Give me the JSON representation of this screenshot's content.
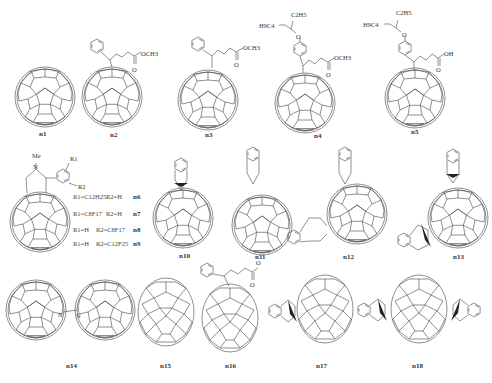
{
  "figure": {
    "compounds": [
      {
        "id": "n1",
        "label": "n1",
        "cage": "C60",
        "addend": "none"
      },
      {
        "id": "n2",
        "label": "n2",
        "cage": "C60",
        "addend": "phenyl-butyric methyl ester (methanofullerene)",
        "groups": [
          "OCH3",
          "O"
        ]
      },
      {
        "id": "n3",
        "label": "n3",
        "cage": "C60",
        "addend": "phenyl-pentanoic methyl ester",
        "groups": [
          "OCH3",
          "O"
        ]
      },
      {
        "id": "n4",
        "label": "n4",
        "cage": "C60",
        "addend": "alkoxyphenyl-butyric methyl ester",
        "groups": [
          "C2H5",
          "H9C4",
          "O",
          "OCH3",
          "O"
        ]
      },
      {
        "id": "n5",
        "label": "n5",
        "cage": "C60",
        "addend": "alkoxyphenyl-butyric acid",
        "groups": [
          "C2H5",
          "H9C4",
          "O",
          "OH",
          "O"
        ]
      },
      {
        "id": "n6-n9",
        "label": "",
        "cage": "C60",
        "addend": "N-methyl fulleropyrrolidine",
        "groups": [
          "Me",
          "N",
          "R1",
          "R2"
        ]
      },
      {
        "id": "n10",
        "label": "n10",
        "cage": "C60",
        "addend": "indene"
      },
      {
        "id": "n11",
        "label": "n11",
        "cage": "C60",
        "addend": "dihydronaphthyl (o-xylylene)"
      },
      {
        "id": "n12",
        "label": "n12",
        "cage": "C60",
        "addend": "bis-dihydronaphthyl"
      },
      {
        "id": "n13",
        "label": "n13",
        "cage": "C60",
        "addend": "bis-indene"
      },
      {
        "id": "n14",
        "label": "n14",
        "cage": "C59N dimer",
        "addend": "azafullerene dimer",
        "groups": [
          "N",
          "N"
        ]
      },
      {
        "id": "n15",
        "label": "n15",
        "cage": "C70",
        "addend": "none"
      },
      {
        "id": "n16",
        "label": "n16",
        "cage": "C70",
        "addend": "phenyl-butyric methyl ester",
        "groups": [
          "O",
          "O"
        ]
      },
      {
        "id": "n17",
        "label": "n17",
        "cage": "C70",
        "addend": "indene"
      },
      {
        "id": "n18",
        "label": "n18",
        "cage": "C70",
        "addend": "bis-indene"
      }
    ],
    "rgroup_table": [
      {
        "r1": "R1=C12H25",
        "r2": "R2=H",
        "label": "n6"
      },
      {
        "r1": "R1=C8F17",
        "r2": "R2=H",
        "label": "n7"
      },
      {
        "r1": "R1=H",
        "r2": "R2=C8F17",
        "label": "n8"
      },
      {
        "r1": "R1=H",
        "r2": "R2=C12F25",
        "label": "n9"
      }
    ],
    "atoms": {
      "och3": "OCH3",
      "o": "O",
      "oh": "OH",
      "c2h5": "C2H5",
      "h9c4": "H9C4",
      "me": "Me",
      "n": "N",
      "r1": "R1",
      "r2": "R2"
    }
  }
}
